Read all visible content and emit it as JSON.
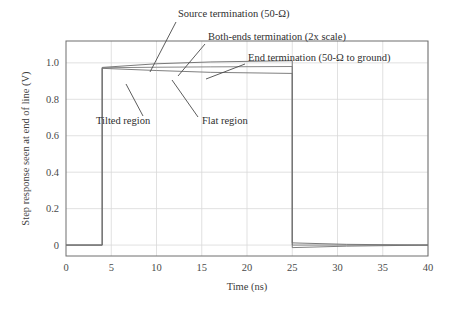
{
  "chart_data": {
    "type": "line",
    "title": "",
    "xlabel": "Time (ns)",
    "ylabel": "Step response seen at end of line (V)",
    "xlim": [
      0,
      40
    ],
    "ylim": [
      -0.06,
      1.12
    ],
    "xticks": [
      0,
      5,
      10,
      15,
      20,
      25,
      30,
      35,
      40
    ],
    "xtick_labels": [
      "0",
      "5",
      "10",
      "15",
      "20",
      "25",
      "30",
      "35",
      "40"
    ],
    "yticks": [
      0,
      0.2,
      0.4,
      0.6,
      0.8,
      1.0
    ],
    "ytick_labels": [
      "0",
      "0.2",
      "0.4",
      "0.6",
      "0.8",
      "1.0"
    ],
    "grid": true,
    "legend_position": "none",
    "pulse": {
      "rise_time_ns": 4.0,
      "fall_time_ns": 25.0,
      "low_level_v": 0.0,
      "plateau_start_v": 0.975
    },
    "series": [
      {
        "name": "Source termination (50-Ω)",
        "color": "#6b6b6b",
        "points": [
          [
            0,
            0.0
          ],
          [
            4.0,
            0.0
          ],
          [
            4.0,
            0.975
          ],
          [
            10.0,
            0.995
          ],
          [
            16.0,
            1.005
          ],
          [
            25.0,
            1.012
          ],
          [
            25.0,
            0.012
          ],
          [
            31.0,
            0.004
          ],
          [
            40.0,
            0.0
          ]
        ]
      },
      {
        "name": "Both-ends termination (2x scale)",
        "color": "#7a7a7a",
        "points": [
          [
            0,
            0.0
          ],
          [
            4.0,
            0.0
          ],
          [
            4.0,
            0.973
          ],
          [
            10.0,
            0.976
          ],
          [
            16.0,
            0.978
          ],
          [
            25.0,
            0.98
          ],
          [
            25.0,
            0.0
          ],
          [
            31.0,
            0.0
          ],
          [
            40.0,
            0.0
          ]
        ]
      },
      {
        "name": "End termination (50-Ω to ground)",
        "color": "#707070",
        "points": [
          [
            0,
            0.0
          ],
          [
            4.0,
            0.0
          ],
          [
            4.0,
            0.97
          ],
          [
            10.0,
            0.958
          ],
          [
            16.0,
            0.948
          ],
          [
            25.0,
            0.942
          ],
          [
            25.0,
            -0.014
          ],
          [
            31.0,
            -0.006
          ],
          [
            40.0,
            0.0
          ]
        ]
      }
    ],
    "annotations": [
      {
        "text": "Source termination (50-Ω)",
        "text_x_px": 178,
        "text_y_px": 17,
        "leader": [
          [
            176,
            22
          ],
          [
            150,
            72
          ]
        ]
      },
      {
        "text": "Both-ends termination (2x scale)",
        "text_x_px": 208,
        "text_y_px": 40,
        "leader": [
          [
            205,
            44
          ],
          [
            178,
            76
          ]
        ]
      },
      {
        "text": "End termination (50-Ω to ground)",
        "text_x_px": 248,
        "text_y_px": 61,
        "leader": [
          [
            245,
            64
          ],
          [
            206,
            79
          ]
        ]
      },
      {
        "text": "Tilted region",
        "text_x_px": 96,
        "text_y_px": 124,
        "leader": [
          [
            143,
            116
          ],
          [
            126,
            84
          ]
        ]
      },
      {
        "text": "Flat region",
        "text_x_px": 202,
        "text_y_px": 124,
        "leader": [
          [
            198,
            117
          ],
          [
            172,
            80
          ]
        ]
      }
    ]
  },
  "plot_geometry": {
    "left_px": 66,
    "right_px": 428,
    "top_px": 41,
    "bottom_px": 256
  },
  "colors": {
    "axis": "#6e6e6e",
    "grid": "#d9d9d9",
    "trace": "#6b6b6b",
    "text": "#333333",
    "background": "#ffffff"
  }
}
